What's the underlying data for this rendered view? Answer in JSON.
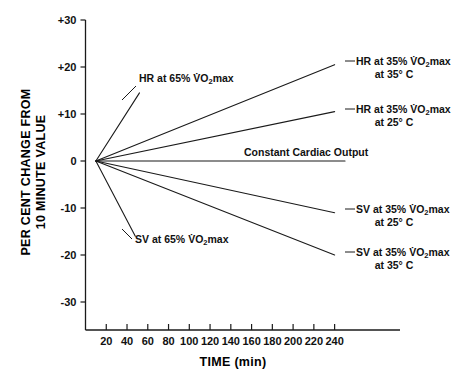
{
  "chart_data": {
    "type": "line",
    "title": "",
    "xlabel": "TIME (min)",
    "ylabel": "PER CENT CHANGE FROM 10 MINUTE VALUE",
    "ylabel_line1": "PER CENT CHANGE FROM",
    "ylabel_line2": "10 MINUTE VALUE",
    "xlim": [
      0,
      250
    ],
    "ylim": [
      -30,
      30
    ],
    "xticks": [
      20,
      40,
      60,
      80,
      100,
      120,
      140,
      160,
      180,
      200,
      220,
      240
    ],
    "yticks": [
      "+30",
      "+20",
      "+10",
      "0",
      "-10",
      "-20",
      "-30"
    ],
    "ytick_values": [
      30,
      20,
      10,
      0,
      -10,
      -20,
      -30
    ],
    "grid": false,
    "legend": "inline-annotations",
    "origin_x": 10,
    "series": [
      {
        "name": "HR at 65% VO2max",
        "label_line1": "HR at 65% V̇O₂max",
        "label_line2": "",
        "x": [
          10,
          52
        ],
        "values": [
          0,
          14.5
        ],
        "label_x": 139,
        "label_y": 82,
        "leader": [
          [
            136,
            86
          ],
          [
            122,
            100
          ]
        ]
      },
      {
        "name": "HR at 35% VO2max at 35 C",
        "label_line1": "HR at 35% V̇O₂max",
        "label_line2": "at 35° C",
        "x": [
          10,
          240
        ],
        "values": [
          0,
          20.5
        ],
        "label_x": 356,
        "label_y": 65,
        "leader": [
          [
            345,
            61
          ],
          [
            355,
            61
          ]
        ]
      },
      {
        "name": "HR at 35% VO2max at 25 C",
        "label_line1": "HR at 35% V̇O₂max",
        "label_line2": "at 25° C",
        "x": [
          10,
          240
        ],
        "values": [
          0,
          10.5
        ],
        "label_x": 356,
        "label_y": 113,
        "leader": [
          [
            345,
            109
          ],
          [
            355,
            109
          ]
        ]
      },
      {
        "name": "Constant Cardiac Output",
        "label_line1": "Constant Cardiac Output",
        "label_line2": "",
        "x": [
          10,
          250
        ],
        "values": [
          0,
          0
        ],
        "label_x": 244,
        "label_y": 156,
        "leader": []
      },
      {
        "name": "SV at 35% VO2max at 25 C",
        "label_line1": "SV at 35% V̇O₂max",
        "label_line2": "at 25° C",
        "x": [
          10,
          240
        ],
        "values": [
          0,
          -11.0
        ],
        "label_x": 356,
        "label_y": 213,
        "leader": [
          [
            345,
            209
          ],
          [
            355,
            209
          ]
        ]
      },
      {
        "name": "SV at 35% VO2max at 35 C",
        "label_line1": "SV at 35% V̇O₂max",
        "label_line2": "at 35° C",
        "x": [
          10,
          240
        ],
        "values": [
          0,
          -20.0
        ],
        "label_x": 356,
        "label_y": 256,
        "leader": [
          [
            345,
            252
          ],
          [
            355,
            252
          ]
        ]
      },
      {
        "name": "SV at 65% VO2max",
        "label_line1": "SV at 65% V̇O₂max",
        "label_line2": "",
        "x": [
          10,
          48
        ],
        "values": [
          0,
          -16.0
        ],
        "label_x": 135,
        "label_y": 243,
        "leader": [
          [
            132,
            239
          ],
          [
            122,
            229
          ]
        ]
      }
    ]
  },
  "colors": {
    "line": "#1a1a1a",
    "text": "#111111",
    "background": "#ffffff"
  }
}
